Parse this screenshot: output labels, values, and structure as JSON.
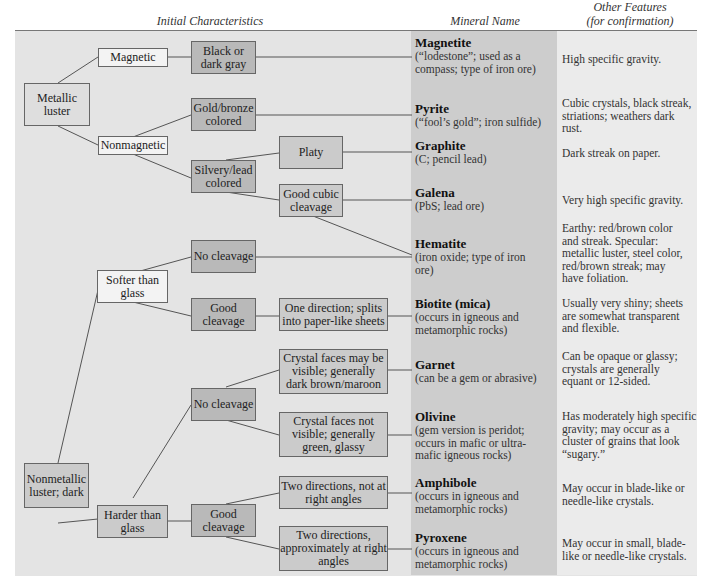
{
  "headers": {
    "initial": "Initial Characteristics",
    "mineral": "Mineral Name",
    "features_line1": "Other Features",
    "features_line2": "(for confirmation)"
  },
  "colors": {
    "panel_bg": "#e4e4e4",
    "mineral_col_bg": "#cdcdcd",
    "features_col_bg": "#ebebeb",
    "box_dark": "#b9b9b9",
    "box_mid": "#cbcbcb",
    "box_white": "#f3f3f3",
    "line": "#555555"
  },
  "boxes": {
    "metallic": "Metallic luster",
    "magnetic": "Magnetic",
    "nonmagnetic": "Nonmagnetic",
    "black_gray": "Black or dark gray",
    "gold_bronze": "Gold/bronze colored",
    "silvery_lead": "Silvery/lead colored",
    "platy": "Platy",
    "good_cubic": "Good cubic cleavage",
    "nonmetallic": "Nonmetallic luster; dark",
    "softer": "Softer than glass",
    "harder": "Harder than glass",
    "soft_no_cleavage": "No cleavage",
    "soft_good_cleavage": "Good cleavage",
    "one_direction": "One direction; splits into paper-like sheets",
    "hard_no_cleavage": "No cleavage",
    "hard_good_cleavage": "Good cleavage",
    "crystal_visible": "Crystal faces may be visible; generally dark brown/maroon",
    "crystal_not_visible": "Crystal faces not visible; generally green, glassy",
    "two_not_right": "Two directions, not at right angles",
    "two_right": "Two directions, approximately at right angles"
  },
  "minerals": [
    {
      "name": "Magnetite",
      "desc": "(“lodestone”; used as a compass; type of iron ore)",
      "features": "High specific gravity."
    },
    {
      "name": "Pyrite",
      "desc": "(“fool’s gold”; iron sulfide)",
      "features": "Cubic crystals, black streak, striations; weathers dark rust."
    },
    {
      "name": "Graphite",
      "desc": "(C; pencil lead)",
      "features": "Dark streak on paper."
    },
    {
      "name": "Galena",
      "desc": "(PbS; lead ore)",
      "features": "Very high specific gravity."
    },
    {
      "name": "Hematite",
      "desc": "(iron oxide; type of iron ore)",
      "features": "Earthy: red/brown color and streak. Specular: metallic luster, steel color, red/brown streak; may have foliation."
    },
    {
      "name": "Biotite (mica)",
      "desc": "(occurs in igneous and metamorphic rocks)",
      "features": "Usually very shiny; sheets are somewhat transparent and flexible."
    },
    {
      "name": "Garnet",
      "desc": "(can be a gem or abrasive)",
      "features": "Can be opaque or glassy; crystals are generally equant or 12-sided."
    },
    {
      "name": "Olivine",
      "desc": "(gem version is peridot; occurs in mafic or ultra-mafic igneous rocks)",
      "features": "Has moderately high specific gravity; may occur as a cluster of grains that look “sugary.”"
    },
    {
      "name": "Amphibole",
      "desc": "(occurs in igneous and metamorphic rocks)",
      "features": "May occur in blade-like or needle-like crystals."
    },
    {
      "name": "Pyroxene",
      "desc": "(occurs in igneous and metamorphic rocks)",
      "features": "May occur in small, blade-like or needle-like crystals."
    }
  ]
}
